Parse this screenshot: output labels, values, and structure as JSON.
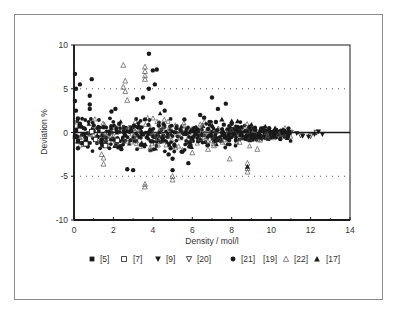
{
  "chart_data": {
    "type": "scatter",
    "title": "",
    "xlabel": "Density / mol/l",
    "ylabel": "Deviation %",
    "xlim": [
      0,
      14
    ],
    "ylim": [
      -10,
      10
    ],
    "xticks": [
      0,
      2,
      4,
      6,
      8,
      10,
      12,
      14
    ],
    "yticks": [
      -10,
      -5,
      0,
      5,
      10
    ],
    "reference_lines": [
      {
        "y": 0,
        "style": "solid"
      },
      {
        "y": 5,
        "style": "dotted"
      },
      {
        "y": -5,
        "style": "dotted"
      }
    ],
    "grid": false,
    "legend_position": "bottom",
    "legend": [
      {
        "label": "[5]",
        "marker": "filled-square"
      },
      {
        "label": "[7]",
        "marker": "open-square"
      },
      {
        "label": "[9]",
        "marker": "filled-down-triangle"
      },
      {
        "label": "[20]",
        "marker": "open-down-triangle"
      },
      {
        "label": "[21]",
        "marker": "filled-circle"
      },
      {
        "label": "[19]",
        "marker": "none"
      },
      {
        "label": "[22]",
        "marker": "open-triangle"
      },
      {
        "label": "[17]",
        "marker": "filled-triangle"
      }
    ],
    "series": [
      {
        "name": "[21]",
        "marker": "filled-circle",
        "points": [
          [
            0.05,
            6.7
          ],
          [
            0.1,
            5.0
          ],
          [
            0.3,
            5.5
          ],
          [
            0.9,
            6.1
          ],
          [
            0.8,
            4.2
          ],
          [
            0.8,
            3.2
          ],
          [
            0.8,
            2.7
          ],
          [
            0.05,
            3.6
          ],
          [
            0.1,
            2.5
          ],
          [
            0.2,
            1.6
          ],
          [
            0.3,
            1.0
          ],
          [
            0.5,
            0.5
          ],
          [
            0.6,
            -0.6
          ],
          [
            0.4,
            -1.2
          ],
          [
            0.2,
            -1.8
          ],
          [
            0.7,
            -1.6
          ],
          [
            1.0,
            0.8
          ],
          [
            1.2,
            -0.5
          ],
          [
            1.5,
            0.6
          ],
          [
            1.9,
            2.4
          ],
          [
            2.1,
            2.7
          ],
          [
            2.3,
            1.0
          ],
          [
            2.6,
            -0.3
          ],
          [
            2.7,
            -4.2
          ],
          [
            3.0,
            -4.3
          ],
          [
            3.2,
            3.8
          ],
          [
            3.5,
            4.0
          ],
          [
            3.8,
            5.0
          ],
          [
            3.6,
            1.5
          ],
          [
            3.9,
            -1.0
          ],
          [
            3.8,
            9.0
          ],
          [
            4.0,
            7.1
          ],
          [
            4.2,
            7.2
          ],
          [
            4.1,
            5.5
          ],
          [
            4.4,
            3.4
          ],
          [
            4.6,
            2.5
          ],
          [
            4.5,
            -0.8
          ],
          [
            4.8,
            -2.5
          ],
          [
            5.0,
            -3.0
          ],
          [
            5.0,
            -4.3
          ],
          [
            5.1,
            -1.5
          ],
          [
            5.4,
            0.3
          ],
          [
            5.8,
            -3.5
          ],
          [
            5.6,
            1.5
          ],
          [
            6.1,
            0.5
          ],
          [
            6.4,
            2.0
          ],
          [
            6.6,
            1.7
          ],
          [
            7.0,
            4.0
          ],
          [
            7.3,
            2.7
          ],
          [
            7.7,
            3.3
          ],
          [
            7.2,
            1.2
          ],
          [
            7.6,
            0.9
          ],
          [
            8.0,
            1.0
          ],
          [
            8.3,
            0.4
          ],
          [
            8.5,
            -0.3
          ],
          [
            8.9,
            0.6
          ],
          [
            9.2,
            0.3
          ],
          [
            9.6,
            0.2
          ],
          [
            9.9,
            0.5
          ],
          [
            10.1,
            0.1
          ],
          [
            10.5,
            0.2
          ],
          [
            10.8,
            0.0
          ],
          [
            2.0,
            -0.8
          ],
          [
            2.9,
            0.2
          ],
          [
            3.3,
            0.6
          ],
          [
            4.3,
            0.8
          ],
          [
            5.2,
            0.5
          ],
          [
            6.0,
            -0.6
          ],
          [
            6.8,
            0.4
          ],
          [
            7.8,
            -0.5
          ],
          [
            8.7,
            -0.7
          ],
          [
            9.4,
            -0.4
          ],
          [
            10.3,
            -0.3
          ],
          [
            1.4,
            -1.2
          ],
          [
            2.4,
            -1.9
          ],
          [
            3.4,
            -1.4
          ],
          [
            4.9,
            -1.8
          ],
          [
            5.5,
            -2.2
          ],
          [
            6.3,
            -1.0
          ],
          [
            7.4,
            -0.9
          ],
          [
            8.1,
            -0.2
          ],
          [
            9.0,
            -0.6
          ],
          [
            10.0,
            -0.1
          ]
        ]
      },
      {
        "name": "[22]",
        "marker": "open-triangle",
        "points": [
          [
            2.5,
            7.7
          ],
          [
            2.6,
            5.9
          ],
          [
            2.5,
            5.2
          ],
          [
            2.6,
            4.7
          ],
          [
            2.7,
            3.7
          ],
          [
            3.6,
            7.5
          ],
          [
            3.6,
            7.0
          ],
          [
            3.6,
            6.5
          ],
          [
            3.6,
            6.1
          ],
          [
            1.5,
            -2.9
          ],
          [
            1.5,
            -3.6
          ],
          [
            1.4,
            -2.5
          ],
          [
            3.6,
            -5.9
          ],
          [
            3.6,
            -6.2
          ],
          [
            5.0,
            -5.0
          ],
          [
            5.0,
            -5.4
          ],
          [
            8.8,
            -3.5
          ],
          [
            8.8,
            -4.1
          ],
          [
            8.8,
            -4.5
          ],
          [
            7.9,
            -3.0
          ],
          [
            9.3,
            -1.9
          ],
          [
            0.2,
            -1.0
          ],
          [
            0.4,
            -0.5
          ],
          [
            1.0,
            -0.3
          ],
          [
            2.0,
            -0.4
          ],
          [
            3.0,
            -0.5
          ],
          [
            4.2,
            -0.3
          ],
          [
            5.4,
            -0.6
          ],
          [
            6.4,
            -0.7
          ],
          [
            7.5,
            -0.8
          ],
          [
            8.4,
            -1.1
          ],
          [
            9.8,
            -0.6
          ],
          [
            10.4,
            -0.2
          ],
          [
            6.8,
            -1.9
          ],
          [
            7.1,
            -1.5
          ],
          [
            6.0,
            -2.3
          ]
        ]
      },
      {
        "name": "[17]",
        "marker": "filled-triangle",
        "points": [
          [
            7.5,
            1.5
          ],
          [
            8.0,
            1.3
          ],
          [
            8.3,
            1.3
          ],
          [
            8.8,
            -3.9
          ],
          [
            9.7,
            0.7
          ],
          [
            10.2,
            0.5
          ],
          [
            9.0,
            0.9
          ]
        ]
      },
      {
        "name": "[5]",
        "marker": "filled-square",
        "points": [
          [
            0.05,
            -0.5
          ],
          [
            0.1,
            0.3
          ],
          [
            0.2,
            -1.0
          ],
          [
            0.5,
            -0.2
          ],
          [
            0.3,
            0.7
          ]
        ]
      },
      {
        "name": "[7]",
        "marker": "open-square",
        "points": [
          [
            0.6,
            -1.3
          ],
          [
            1.1,
            -0.8
          ],
          [
            1.6,
            -1.5
          ],
          [
            2.2,
            -0.9
          ],
          [
            0.9,
            0.1
          ]
        ]
      },
      {
        "name": "[9]",
        "marker": "filled-down-triangle",
        "points": [
          [
            11.3,
            -0.1
          ],
          [
            11.6,
            -0.4
          ],
          [
            11.9,
            -0.5
          ],
          [
            12.2,
            -0.2
          ],
          [
            12.4,
            0.1
          ],
          [
            12.6,
            -0.2
          ]
        ]
      },
      {
        "name": "[20]",
        "marker": "open-down-triangle",
        "points": [
          [
            11.0,
            0.0
          ],
          [
            11.5,
            -0.3
          ],
          [
            12.0,
            -0.4
          ],
          [
            12.3,
            0.0
          ]
        ]
      }
    ]
  },
  "figure": {
    "xlabel": "Density / mol/l",
    "ylabel": "Deviation %"
  }
}
